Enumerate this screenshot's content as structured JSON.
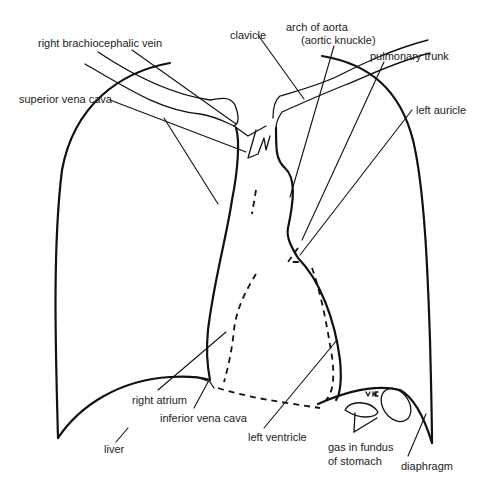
{
  "diagram": {
    "title": "",
    "labels": {
      "right_brachiocephalic_vein": "right brachiocephalic vein",
      "superior_vena_cava": "superior vena cava",
      "clavicle": "clavicle",
      "arch_of_aorta_line1": "arch of aorta",
      "arch_of_aorta_line2": "(aortic knuckle)",
      "pulmonary_trunk": "pulmonary trunk",
      "left_auricle": "left auricle",
      "right_atrium": "right atrium",
      "inferior_vena_cava": "inferior vena cava",
      "liver": "liver",
      "left_ventricle": "left ventricle",
      "gas_in_fundus_line1": "gas in fundus",
      "gas_in_fundus_line2": "of stomach",
      "diaphragm": "diaphragm"
    },
    "colors": {
      "line": "#111111",
      "text": "#222222",
      "background": "#ffffff"
    }
  }
}
